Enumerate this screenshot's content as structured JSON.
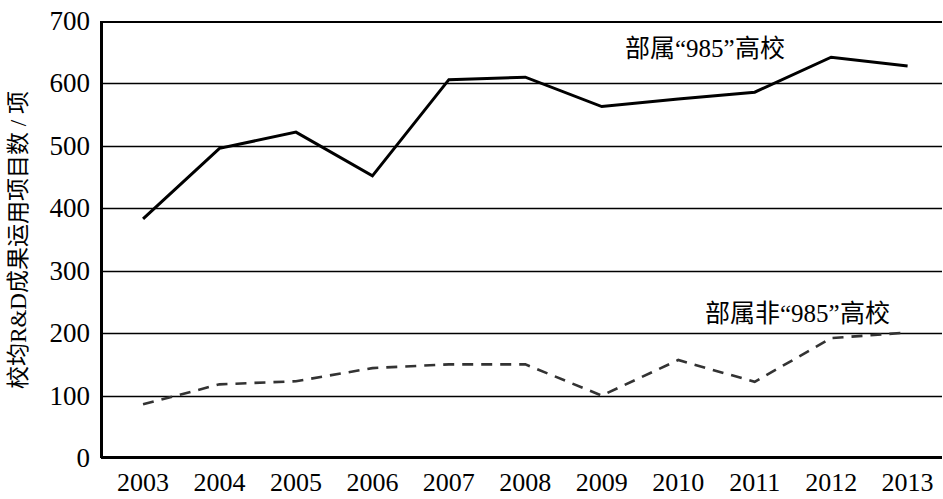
{
  "chart_data": {
    "type": "line",
    "title": "",
    "xlabel": "",
    "ylabel": "校均R&D成果运用项目数 / 项",
    "x": [
      "2003",
      "2004",
      "2005",
      "2006",
      "2007",
      "2008",
      "2009",
      "2010",
      "2011",
      "2012",
      "2013"
    ],
    "categories": [
      "2003",
      "2004",
      "2005",
      "2006",
      "2007",
      "2008",
      "2009",
      "2010",
      "2011",
      "2012",
      "2013"
    ],
    "ylim": [
      0,
      700
    ],
    "yticks": [
      "0",
      "100",
      "200",
      "300",
      "400",
      "500",
      "600",
      "700"
    ],
    "ytick_values": [
      0,
      100,
      200,
      300,
      400,
      500,
      600,
      700
    ],
    "grid": true,
    "grid_axis": "y",
    "legend_position": "inline-annotation",
    "series": [
      {
        "name": "部属“985”高校",
        "style": "solid",
        "color": "#000000",
        "width": 3,
        "values": [
          383,
          496,
          522,
          452,
          606,
          610,
          563,
          575,
          586,
          642,
          628
        ],
        "label_x": 2010,
        "label_y": 668
      },
      {
        "name": "部属非“985”高校",
        "style": "dashed",
        "color": "#333333",
        "width": 2.6,
        "values": [
          86,
          118,
          123,
          144,
          150,
          150,
          100,
          157,
          122,
          192,
          201
        ],
        "label_x": 2010.3,
        "label_y": 252
      }
    ]
  },
  "axes": {
    "y_tick_labels": [
      "700",
      "600",
      "500",
      "400",
      "300",
      "200",
      "100",
      "0"
    ],
    "x_tick_labels": [
      "2003",
      "2004",
      "2005",
      "2006",
      "2007",
      "2008",
      "2009",
      "2010",
      "2011",
      "2012",
      "2013"
    ],
    "y_axis_title": "校均R&D成果运用项目数 / 项"
  },
  "annotations": {
    "series_985": "部属“985”高校",
    "series_non985": "部属非“985”高校"
  },
  "colors": {
    "background": "#ffffff",
    "axis": "#000000",
    "gridline": "#000000",
    "solid_series": "#000000",
    "dashed_series": "#333333"
  }
}
